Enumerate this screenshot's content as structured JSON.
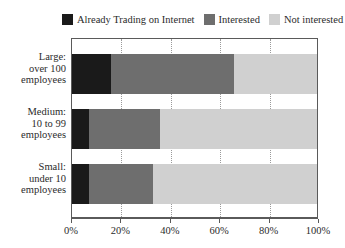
{
  "chart_data": {
    "type": "bar",
    "orientation": "horizontal",
    "stacked": true,
    "normalized_percent": true,
    "title": "",
    "xlabel": "",
    "ylabel": "",
    "xlim": [
      0,
      100
    ],
    "grid": true,
    "legend_position": "top",
    "categories": [
      "Large: over 100 employees",
      "Medium: 10 to 99 employees",
      "Small: under 10 employees"
    ],
    "category_lines": [
      [
        "Large:",
        "over 100",
        "employees"
      ],
      [
        "Medium:",
        "10 to 99",
        "employees"
      ],
      [
        "Small:",
        "under 10",
        "employees"
      ]
    ],
    "series": [
      {
        "name": "Already Trading on Internet",
        "color": "#1a1a1a",
        "values": [
          16,
          7,
          7
        ]
      },
      {
        "name": "Interested",
        "color": "#6e6e6e",
        "values": [
          50,
          29,
          26
        ]
      },
      {
        "name": "Not interested",
        "color": "#d0d0d0",
        "values": [
          34,
          64,
          67
        ]
      }
    ],
    "xticks": [
      0,
      20,
      40,
      60,
      80,
      100
    ],
    "xtick_labels": [
      "0%",
      "20%",
      "40%",
      "60%",
      "80%",
      "100%"
    ]
  },
  "legend": {
    "items": [
      {
        "label": "Already Trading on Internet",
        "swatch": "legend-swatch-already-trading"
      },
      {
        "label": "Interested",
        "swatch": "legend-swatch-interested"
      },
      {
        "label": "Not interested",
        "swatch": "legend-swatch-not-interested"
      }
    ]
  },
  "colors": {
    "already_trading": "#1a1a1a",
    "interested": "#6e6e6e",
    "not_interested": "#d0d0d0",
    "frame": "#5a5a5a",
    "gridline": "#9a9a9a",
    "text": "#2b2b2b",
    "background": "#ffffff"
  }
}
